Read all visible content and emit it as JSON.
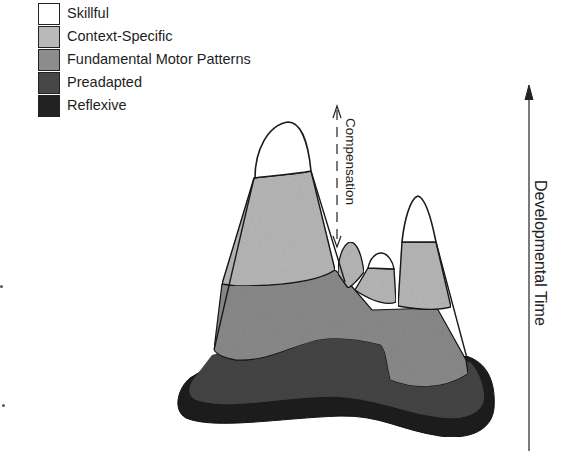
{
  "diagram": {
    "type": "developmental-landscape",
    "legend": [
      {
        "label": "Skillful",
        "color": "#ffffff"
      },
      {
        "label": "Context-Specific",
        "color": "#b9b9b9"
      },
      {
        "label": "Fundamental Motor Patterns",
        "color": "#8c8c8c"
      },
      {
        "label": "Preadapted",
        "color": "#474747"
      },
      {
        "label": "Reflexive",
        "color": "#222222"
      }
    ],
    "annotations": {
      "compensation": "Compensation",
      "axis_label": "Developmental Time"
    },
    "colors": {
      "skillful": "#ffffff",
      "context_specific": "#b9b9b9",
      "fundamental": "#8c8c8c",
      "preadapted": "#474747",
      "reflexive": "#222222",
      "outline": "#1a1a1a"
    }
  }
}
